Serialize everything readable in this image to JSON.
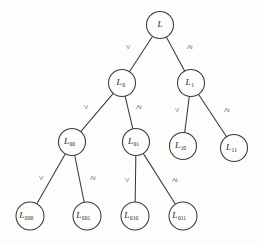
{
  "figure": {
    "name": "binary-search-tree-of-labels",
    "background_color": "#fdfdfb",
    "stroke_color": "#3a3a38",
    "text_color": "#262624"
  },
  "symbols": {
    "less_than": "<",
    "greater_equal": "≥"
  },
  "nodes": [
    {
      "id": "L",
      "base": "L",
      "sub": "",
      "cx": 160,
      "cy": 25,
      "r": 13.5
    },
    {
      "id": "L0",
      "base": "L",
      "sub": "0",
      "cx": 122,
      "cy": 83,
      "r": 13.5
    },
    {
      "id": "L1",
      "base": "L",
      "sub": "1",
      "cx": 191,
      "cy": 83,
      "r": 13.5
    },
    {
      "id": "L00",
      "base": "L",
      "sub": "00",
      "cx": 72,
      "cy": 142,
      "r": 13.5
    },
    {
      "id": "L01",
      "base": "L",
      "sub": "01",
      "cx": 136,
      "cy": 142,
      "r": 13.5
    },
    {
      "id": "L10",
      "base": "L",
      "sub": "10",
      "cx": 183,
      "cy": 146,
      "r": 13.5
    },
    {
      "id": "L11",
      "base": "L",
      "sub": "11",
      "cx": 234,
      "cy": 148,
      "r": 13.5
    },
    {
      "id": "L000",
      "base": "L",
      "sub": "000",
      "cx": 30,
      "cy": 216,
      "r": 14.0
    },
    {
      "id": "L001",
      "base": "L",
      "sub": "001",
      "cx": 87,
      "cy": 216,
      "r": 14.0
    },
    {
      "id": "L010",
      "base": "L",
      "sub": "010",
      "cx": 135,
      "cy": 216,
      "r": 14.0
    },
    {
      "id": "L011",
      "base": "L",
      "sub": "011",
      "cx": 183,
      "cy": 216,
      "r": 14.0
    }
  ],
  "edges": [
    {
      "id": "L-L0",
      "from": "L",
      "to": "L0",
      "label": "<",
      "lx": 129,
      "ly": 47
    },
    {
      "id": "L-L1",
      "from": "L",
      "to": "L1",
      "label": "≥",
      "lx": 190,
      "ly": 47
    },
    {
      "id": "L0-L00",
      "from": "L0",
      "to": "L00",
      "label": "<",
      "lx": 87,
      "ly": 107
    },
    {
      "id": "L0-L01",
      "from": "L0",
      "to": "L01",
      "label": "≥",
      "lx": 139,
      "ly": 107
    },
    {
      "id": "L1-L10",
      "from": "L1",
      "to": "L10",
      "label": "<",
      "lx": 178,
      "ly": 110
    },
    {
      "id": "L1-L11",
      "from": "L1",
      "to": "L11",
      "label": "≥",
      "lx": 227,
      "ly": 110
    },
    {
      "id": "L00-L000",
      "from": "L00",
      "to": "L000",
      "label": "<",
      "lx": 42,
      "ly": 178
    },
    {
      "id": "L00-L001",
      "from": "L00",
      "to": "L001",
      "label": "≥",
      "lx": 93,
      "ly": 178
    },
    {
      "id": "L01-L010",
      "from": "L01",
      "to": "L010",
      "label": "<",
      "lx": 128,
      "ly": 180
    },
    {
      "id": "L01-L011",
      "from": "L01",
      "to": "L011",
      "label": "≥",
      "lx": 175,
      "ly": 180
    }
  ]
}
